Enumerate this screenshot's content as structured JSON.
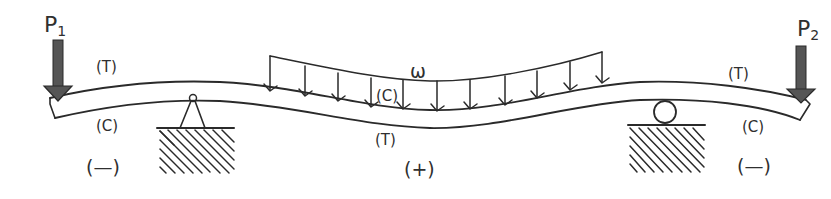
{
  "diagram": {
    "loads": {
      "p1": {
        "label": "P",
        "subscript": "1"
      },
      "p2": {
        "label": "P",
        "subscript": "2"
      },
      "distributed": {
        "label": "ω",
        "arrow_count": 11
      }
    },
    "supports": {
      "left": {
        "type": "pin"
      },
      "right": {
        "type": "roller"
      }
    },
    "regions": {
      "left_overhang": {
        "top": "(T)",
        "bottom": "(C)",
        "moment_sign": "(—)"
      },
      "mid_span": {
        "top": "(C)",
        "bottom": "(T)",
        "moment_sign": "(+)"
      },
      "right_overhang": {
        "top": "(T)",
        "bottom": "(C)",
        "moment_sign": "(—)"
      }
    },
    "colors": {
      "ink": "#2a2a2a",
      "arrow_fill": "#555555",
      "background": "#ffffff"
    }
  }
}
